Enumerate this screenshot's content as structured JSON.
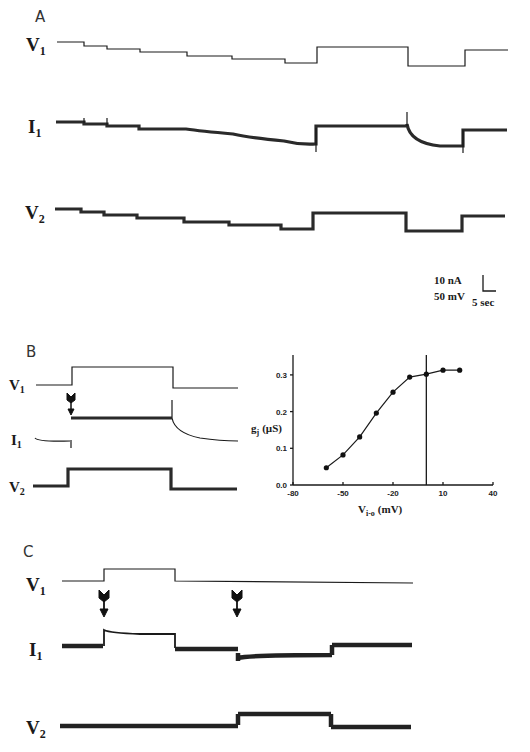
{
  "figure": {
    "panels": {
      "A": {
        "letter": "A",
        "labels": {
          "v1": "V",
          "v1_sub": "1",
          "i1": "I",
          "i1_sub": "1",
          "v2": "V",
          "v2_sub": "2"
        },
        "scale_bar": {
          "current": "10 nA",
          "voltage": "50 mV",
          "time": "5 sec"
        }
      },
      "B": {
        "letter": "B",
        "labels": {
          "v1": "V",
          "v1_sub": "1",
          "i1": "I",
          "i1_sub": "1",
          "v2": "V",
          "v2_sub": "2"
        }
      },
      "C": {
        "letter": "C",
        "labels": {
          "v1": "V",
          "v1_sub": "1",
          "i1": "I",
          "i1_sub": "1",
          "v2": "V",
          "v2_sub": "2"
        }
      }
    },
    "traces": {
      "A_v1": "M57,42 H84 V46 H107 V49 H140 V52 H187 V56 H232 V59 H285 V63 H317 V47 H408 V66 H465 V50 H508",
      "A_i1": "M56,122 H84 V124 H107 V126 H139 V129 H186 Q200,131 233,134 Q250,138 284,141 Q300,145 316,144 V126 H407 V124 Q410,143 440,146 H463 V130 H507",
      "A_i1_spikes": "M84,118 V123 M107,118 V125 M407,112 V126 M316,128 V152 M463,130 V153",
      "A_v2": "M55,209 H81 V212 H104 V215 H137 V218 H184 V222 H229 V225 H281 V229 H313 V213 H406 V231 H462 V216 H505",
      "B_v1": "M36,385 H72 V367 H173 V388 H238",
      "B_i1_thin": "M35,438 Q38,442 70,441 M71,440 V448 M172,400 V418 Q175,433 200,438 Q220,441 238,441",
      "B_i1_thick": "M71,418 H172",
      "B_v2": "M33,486 H68 V469 H171 V489 H237",
      "C_v1": "M62,581 H104 V569 H175 V581 Q300,582 413,583",
      "C_i1_thin": "M104,646 V630 Q110,633 140,634 H175 V648",
      "C_i1_thick": "M62,646 H103 M175,649 H238 M238,653 V661 M238,658 Q250,655 332,655 M332,655 V645 M332,645 H412",
      "C_v2": "M60,726 H238 M238,725 V714 M238,714 H331 M331,714 V727 M331,727 H411",
      "scale_bar": "M483,275 V291 H496"
    },
    "arrows": [
      {
        "id": "B_arrow",
        "x": 71,
        "y1": 393,
        "y2": 415
      },
      {
        "id": "C_arrow_1",
        "x": 104,
        "y1": 590,
        "y2": 616
      },
      {
        "id": "C_arrow_2",
        "x": 237,
        "y1": 590,
        "y2": 616
      }
    ]
  },
  "chart_data": {
    "type": "line",
    "title": "",
    "xlabel": "V",
    "xlabel_sub": "i-o",
    "xlabel_unit": "(mV)",
    "ylabel": "g",
    "ylabel_sub": "j",
    "ylabel_unit": "(µS)",
    "xlim": [
      -80,
      40
    ],
    "ylim": [
      0,
      0.35
    ],
    "x_ticks": [
      -80,
      -50,
      -20,
      10,
      40
    ],
    "y_ticks": [
      0.0,
      0.1,
      0.2,
      0.3
    ],
    "x_tick_labels": [
      "-80",
      "-50",
      "-20",
      "10",
      "40"
    ],
    "y_tick_labels": [
      "0.0",
      "0.1",
      "0.2",
      "0.3"
    ],
    "grid": false,
    "vertical_reference_line_x": 0,
    "series": [
      {
        "name": "gj",
        "marker": "filled-circle",
        "x": [
          -60,
          -50,
          -40,
          -30,
          -20,
          -10,
          0,
          10,
          20
        ],
        "y": [
          0.047,
          0.082,
          0.131,
          0.196,
          0.253,
          0.294,
          0.302,
          0.313,
          0.313
        ]
      }
    ]
  }
}
